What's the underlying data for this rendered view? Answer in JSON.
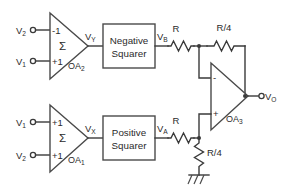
{
  "diagram": {
    "colors": {
      "wire": "#3a3a3a",
      "shape_stroke": "#4a4a4a",
      "text": "#2b2b2b",
      "background": "#ffffff"
    },
    "inputs": {
      "top_amp": [
        {
          "label": "V",
          "sub": "2",
          "terminal_sign": "-1"
        },
        {
          "label": "V",
          "sub": "1",
          "terminal_sign": "+1"
        }
      ],
      "bottom_amp": [
        {
          "label": "V",
          "sub": "1",
          "terminal_sign": "+1"
        },
        {
          "label": "V",
          "sub": "2",
          "terminal_sign": "+1"
        }
      ]
    },
    "amplifiers": {
      "top": {
        "name": "OA",
        "name_sub": "2",
        "symbol": "Σ",
        "output_label": "V",
        "output_sub": "Y"
      },
      "bottom": {
        "name": "OA",
        "name_sub": "1",
        "symbol": "Σ",
        "output_label": "V",
        "output_sub": "X"
      },
      "opamp": {
        "name": "OA",
        "name_sub": "3",
        "inverting_sign": "-",
        "noninverting_sign": "+"
      }
    },
    "blocks": {
      "negative_squarer": {
        "line1": "Negative",
        "line2": "Squarer",
        "output_label": "V",
        "output_sub": "B"
      },
      "positive_squarer": {
        "line1": "Positive",
        "line2": "Squarer",
        "output_label": "V",
        "output_sub": "A"
      }
    },
    "resistors": {
      "top_input": "R",
      "top_feedback": "R/4",
      "bottom_input": "R",
      "bottom_ground": "R/4"
    },
    "output": {
      "label": "V",
      "sub": "O"
    },
    "ground": {
      "name": "ground-symbol"
    }
  }
}
